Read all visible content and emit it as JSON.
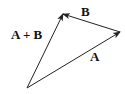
{
  "diagram": {
    "colors": {
      "stroke": "#222222",
      "text": "#111111",
      "background": "#ffffff"
    },
    "points": {
      "origin": [
        27,
        88
      ],
      "a_tip": [
        120,
        32
      ],
      "sum_tip": [
        63,
        14
      ]
    },
    "vectors": [
      {
        "id": "A",
        "label": "A",
        "from": "origin",
        "to": "a_tip"
      },
      {
        "id": "B",
        "label": "B",
        "from": "a_tip",
        "to": "sum_tip"
      },
      {
        "id": "A+B",
        "label": "A + B",
        "from": "origin",
        "to": "sum_tip"
      }
    ],
    "labels": {
      "a": "A",
      "b": "B",
      "sum": "A + B"
    }
  }
}
